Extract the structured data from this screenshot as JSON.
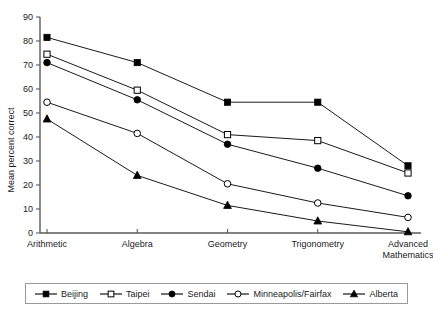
{
  "chart_data": {
    "type": "line",
    "title": "",
    "xlabel": "",
    "ylabel": "Mean percent correct",
    "ylim": [
      0,
      90
    ],
    "ytick_step": 10,
    "grid": false,
    "legend_position": "bottom",
    "categories": [
      "Arithmetic",
      "Algebra",
      "Geometry",
      "Trigonometry",
      "Advanced\nMathematics"
    ],
    "category_labels": [
      {
        "line1": "Arithmetic",
        "line2": ""
      },
      {
        "line1": "Algebra",
        "line2": ""
      },
      {
        "line1": "Geometry",
        "line2": ""
      },
      {
        "line1": "Trigonometry",
        "line2": ""
      },
      {
        "line1": "Advanced",
        "line2": "Mathematics"
      }
    ],
    "ytick_labels": [
      "0",
      "10",
      "20",
      "30",
      "40",
      "50",
      "60",
      "70",
      "80",
      "90"
    ],
    "ytick_values": [
      0,
      10,
      20,
      30,
      40,
      50,
      60,
      70,
      80,
      90
    ],
    "series": [
      {
        "name": "Beijing",
        "marker": "filled-square",
        "color": "#000000",
        "values": [
          81.5,
          71.0,
          54.5,
          54.5,
          28.0
        ]
      },
      {
        "name": "Taipei",
        "marker": "open-square",
        "color": "#000000",
        "values": [
          74.5,
          59.5,
          41.0,
          38.5,
          25.0
        ]
      },
      {
        "name": "Sendai",
        "marker": "filled-circle",
        "color": "#000000",
        "values": [
          71.0,
          55.5,
          37.0,
          27.0,
          15.5
        ]
      },
      {
        "name": "Minneapolis/Fairfax",
        "marker": "open-circle",
        "color": "#000000",
        "values": [
          54.5,
          41.5,
          20.5,
          12.5,
          6.5
        ]
      },
      {
        "name": "Alberta",
        "marker": "filled-triangle",
        "color": "#000000",
        "values": [
          47.5,
          24.0,
          11.5,
          5.0,
          0.5
        ]
      }
    ]
  },
  "legend": {
    "items": [
      {
        "label": "Beijing",
        "marker": "filled-square"
      },
      {
        "label": "Taipei",
        "marker": "open-square"
      },
      {
        "label": "Sendai",
        "marker": "filled-circle"
      },
      {
        "label": "Minneapolis/Fairfax",
        "marker": "open-circle"
      },
      {
        "label": "Alberta",
        "marker": "filled-triangle"
      }
    ]
  }
}
